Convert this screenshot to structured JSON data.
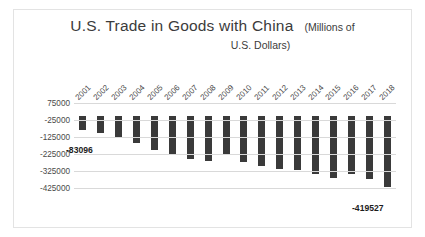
{
  "chart_data": {
    "type": "bar",
    "title": "U.S. Trade in Goods with China",
    "title_units": "(Millions of",
    "title_units_line2": "U.S. Dollars)",
    "subtitle": "(Millions of U.S. Dollars)",
    "xlabel": "",
    "ylabel": "",
    "grid": true,
    "legend": false,
    "ylim": [
      -475000,
      75000
    ],
    "yticks": [
      75000,
      -25000,
      -125000,
      -225000,
      -325000,
      -425000
    ],
    "ytick_labels": [
      "75000",
      "-25000",
      "-125000",
      "-225000",
      "-325000",
      "-425000"
    ],
    "categories": [
      "2001",
      "2002",
      "2003",
      "2004",
      "2005",
      "2006",
      "2007",
      "2008",
      "2009",
      "2010",
      "2011",
      "2012",
      "2013",
      "2014",
      "2015",
      "2016",
      "2017",
      "2018"
    ],
    "values": [
      -83096,
      -103065,
      -124068,
      -162254,
      -202278,
      -234101,
      -258506,
      -268040,
      -226877,
      -273042,
      -295250,
      -315103,
      -318684,
      -344818,
      -367328,
      -346996,
      -375576,
      -419527
    ],
    "bar_color": "#3a3a3a",
    "data_labels": [
      {
        "category": "2001",
        "value": -83096,
        "text": "-83096"
      },
      {
        "category": "2018",
        "value": -419527,
        "text": "-419527"
      }
    ]
  },
  "axis": {
    "y_ticks": [
      "75000",
      "-25000",
      "-125000",
      "-225000",
      "-325000",
      "-425000"
    ],
    "x_ticks": [
      "2001",
      "2002",
      "2003",
      "2004",
      "2005",
      "2006",
      "2007",
      "2008",
      "2009",
      "2010",
      "2011",
      "2012",
      "2013",
      "2014",
      "2015",
      "2016",
      "2017",
      "2018"
    ]
  },
  "labels": {
    "first": "-83096",
    "last": "-419527"
  },
  "colors": {
    "bar": "#3a3a3a",
    "grid": "#d9d9d9",
    "text": "#4a4a4a",
    "border": "#e3e3e3",
    "background": "#ffffff"
  }
}
